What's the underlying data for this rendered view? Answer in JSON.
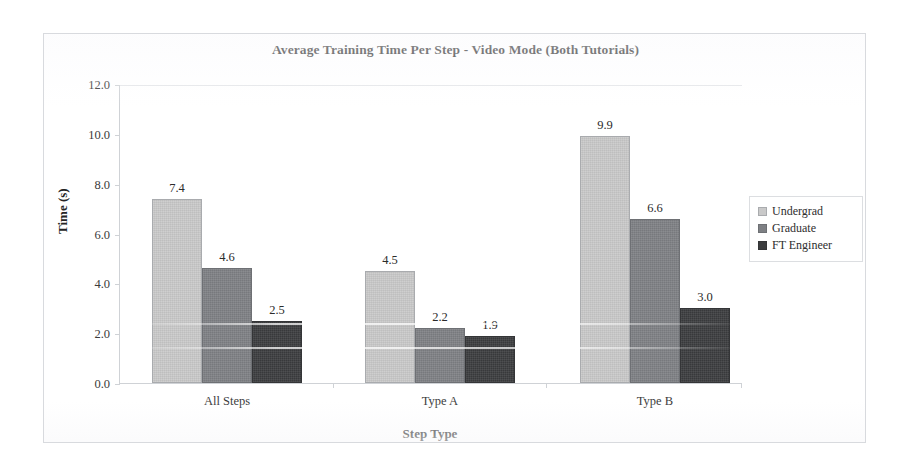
{
  "chart_data": {
    "type": "bar",
    "title": "Average Training Time Per Step - Video Mode (Both Tutorials)",
    "xlabel": "Step Type",
    "ylabel": "Time (s)",
    "categories": [
      "All Steps",
      "Type A",
      "Type B"
    ],
    "series": [
      {
        "name": "Undergrad",
        "color": "#c9c9c9",
        "values": [
          7.4,
          4.5,
          9.9
        ],
        "labels": [
          "7.4",
          "4.5",
          "9.9"
        ]
      },
      {
        "name": "Graduate",
        "color": "#7e8084",
        "values": [
          4.6,
          2.2,
          6.6
        ],
        "labels": [
          "4.6",
          "2.2",
          "6.6"
        ]
      },
      {
        "name": "FT Engineer",
        "color": "#3b3c3e",
        "values": [
          2.5,
          1.9,
          3.0
        ],
        "labels": [
          "2.5",
          "1.9",
          "3.0"
        ]
      }
    ],
    "ylim": [
      0,
      12
    ],
    "ytick_labels": [
      "0.0",
      "2.0",
      "4.0",
      "6.0",
      "8.0",
      "10.0",
      "12.0"
    ],
    "ytick_values": [
      0,
      2,
      4,
      6,
      8,
      10,
      12
    ],
    "grid": false,
    "legend_position": "right",
    "axis_color": "#cfd2d6",
    "text_color": "#2a2a2a"
  },
  "legend": {
    "entries": [
      "Undergrad",
      "Graduate",
      "FT Engineer"
    ]
  }
}
